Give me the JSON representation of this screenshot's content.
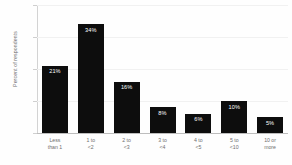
{
  "chart_data": {
    "type": "bar",
    "title": "",
    "xlabel": "",
    "ylabel": "Percent of respondents",
    "categories": [
      "Less than 1",
      "1 to <2",
      "2 to <3",
      "3 to <4",
      "4 to <5",
      "5 to <10",
      "10 or more"
    ],
    "category_lines": [
      [
        "Less",
        "than 1"
      ],
      [
        "1 to",
        "<2"
      ],
      [
        "2 to",
        "<3"
      ],
      [
        "3 to",
        "<4"
      ],
      [
        "4 to",
        "<5"
      ],
      [
        "5 to",
        "<10"
      ],
      [
        "10 or",
        "more"
      ]
    ],
    "values": [
      21,
      34,
      16,
      8,
      6,
      10,
      5
    ],
    "value_labels": [
      "21%",
      "34%",
      "16%",
      "8%",
      "6%",
      "10%",
      "5%"
    ],
    "ylim": [
      0,
      40
    ],
    "yticks": [
      0,
      10,
      20,
      30,
      40
    ],
    "ytick_labels": [
      "0%",
      "10%",
      "20%",
      "30%",
      "40%"
    ],
    "grid": true,
    "legend": false,
    "bar_color": "#0d0d0d",
    "axis_color": "#bdbdbd",
    "grid_color": "#f1f1f1",
    "text_color": "#6f6f6f",
    "value_label_color": "#ffffff",
    "background_color": "#fefefe"
  }
}
